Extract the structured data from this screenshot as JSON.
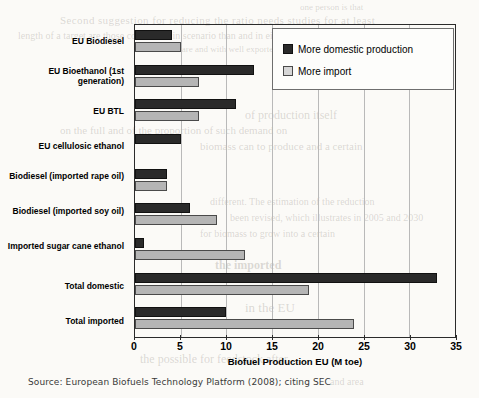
{
  "chart_data": {
    "type": "bar",
    "orientation": "horizontal",
    "title": "",
    "xlabel": "Biofuel Production EU (M toe)",
    "ylabel": "",
    "xlim": [
      0,
      35
    ],
    "xticks": [
      0,
      5,
      10,
      15,
      20,
      25,
      30,
      35
    ],
    "grid": true,
    "legend_position": "top-right",
    "categories": [
      "EU Biodiesel",
      "EU Bioethanol (1st generation)",
      "EU BTL",
      "EU cellulosic ethanol",
      "Biodiesel (imported rape oil)",
      "Biodiesel (imported soy oil)",
      "Imported sugar cane ethanol",
      "Total domestic",
      "Total imported"
    ],
    "series": [
      {
        "name": "More domestic production",
        "color": "#2a2a2a",
        "values": [
          4,
          13,
          11,
          5,
          3.5,
          6,
          1,
          33,
          10
        ]
      },
      {
        "name": "More import",
        "color": "#b5b5b5",
        "values": [
          5,
          7,
          7,
          0,
          3.5,
          9,
          12,
          19,
          24
        ]
      }
    ]
  },
  "legend": {
    "items": [
      {
        "label": "More domestic production",
        "swatch": "dark"
      },
      {
        "label": "More import",
        "swatch": "light"
      }
    ]
  },
  "axis": {
    "x_title": "Biofuel Production EU (M toe)",
    "tick_labels": [
      "0",
      "5",
      "10",
      "15",
      "20",
      "25",
      "30",
      "35"
    ]
  },
  "source": {
    "text": "Source: European Biofuels Technology Platform (2008); citing SEC"
  },
  "bleed_text": {
    "b1": "one person is that",
    "b2": "Second suggestion for reducing the ratio needs studies for at least",
    "b3": "length of a target are those considered in scenario than and in eight",
    "b4": "biomass are and with well exported",
    "b5": "of production itself",
    "b6": "on the full and of the proportion of such demand on",
    "b7": "biomass can to produce and a certain",
    "b8": "different. The estimation of the reduction",
    "b9": "been revised, which illustrates in 2005 and 2030",
    "b10": "for biomass to grow into a certain",
    "b11": "the imported",
    "b12": "in the EU",
    "b13": "the possible for feedstock after",
    "b14": "and area"
  }
}
